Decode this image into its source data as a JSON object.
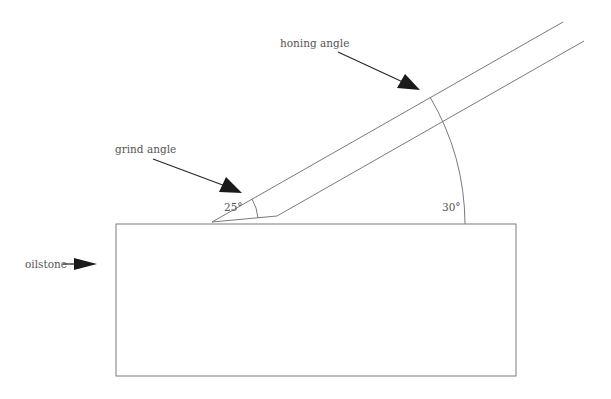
{
  "diagram": {
    "labels": {
      "honing_angle": "honing angle",
      "grind_angle": "grind angle",
      "oilstone": "oilstone",
      "grind_angle_value": "25°",
      "honing_angle_value": "30°"
    },
    "colors": {
      "line": "#7a7a7a",
      "arrow": "#1a1a1a",
      "text": "#555555",
      "background": "#ffffff"
    },
    "geometry": {
      "oilstone_rect": {
        "x": 116,
        "y": 224,
        "width": 400,
        "height": 152
      },
      "blade_tip": [
        212,
        222
      ],
      "blade_top_end": [
        563,
        22
      ],
      "bevel_corner": [
        277,
        216
      ],
      "blade_bottom_end": [
        584,
        41
      ]
    }
  }
}
